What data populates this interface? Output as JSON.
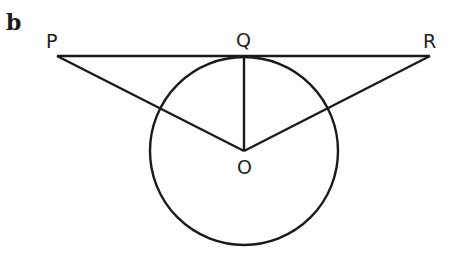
{
  "diagram": {
    "part_label": "b",
    "points": {
      "P": {
        "label": "P",
        "x": 57,
        "y": 56
      },
      "Q": {
        "label": "Q",
        "x": 244,
        "y": 56
      },
      "R": {
        "label": "R",
        "x": 430,
        "y": 56
      },
      "O": {
        "label": "O",
        "x": 244,
        "y": 151
      }
    },
    "circle": {
      "center": "O",
      "radius": 94
    },
    "segments": [
      "PR",
      "PO",
      "QO",
      "RO"
    ],
    "stroke_color": "#1a1a1a"
  }
}
